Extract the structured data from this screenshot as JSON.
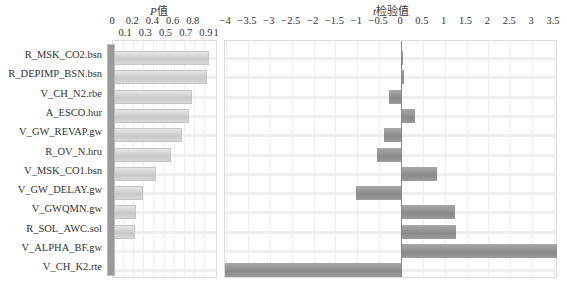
{
  "chart_data": [
    {
      "type": "bar",
      "orientation": "horizontal",
      "title": "P值",
      "xlabel": "P值",
      "xlim": [
        0,
        1
      ],
      "xticks_top": [
        "0",
        "0.2",
        "0.4",
        "0.6",
        "0.8"
      ],
      "xticks_bottom": [
        "0.1",
        "0.3",
        "0.5",
        "0.7",
        "0.9",
        "1"
      ],
      "grid": true,
      "categories": [
        "R_MSK_CO2.bsn",
        "R_DEPIMP_BSN.bsn",
        "V_CH_N2.rbe",
        "A_ESCO.hur",
        "V_GW_REVAP.gw",
        "R_OV_N.hru",
        "V_MSK_CO1.bsn",
        "V_GW_DELAY.gw",
        "V_GWQMN.gw",
        "R_SOL_AWC.sol",
        "V_ALPHA_BF.gw",
        "V_CH_K2.rte"
      ],
      "values": [
        0.95,
        0.93,
        0.78,
        0.75,
        0.68,
        0.57,
        0.43,
        0.3,
        0.23,
        0.22,
        0.0,
        0.0
      ]
    },
    {
      "type": "bar",
      "orientation": "horizontal",
      "title": "t检验值",
      "xlabel": "t检验值",
      "xlim": [
        -4,
        3.5
      ],
      "xticks": [
        "-4",
        "-3.5",
        "-3",
        "-2.5",
        "-2",
        "-1.5",
        "-1",
        "-0.5",
        "0",
        "0.5",
        "1",
        "1.5",
        "2",
        "2.5",
        "3",
        "3.5"
      ],
      "grid": true,
      "categories": [
        "R_MSK_CO2.bsn",
        "R_DEPIMP_BSN.bsn",
        "V_CH_N2.rbe",
        "A_ESCO.hur",
        "V_GW_REVAP.gw",
        "R_OV_N.hru",
        "V_MSK_CO1.bsn",
        "V_GW_DELAY.gw",
        "V_GWQMN.gw",
        "R_SOL_AWC.sol",
        "V_ALPHA_BF.gw",
        "V_CH_K2.rte"
      ],
      "values": [
        0.05,
        0.07,
        -0.27,
        0.32,
        -0.4,
        -0.55,
        0.82,
        -1.04,
        1.23,
        1.25,
        3.57,
        -4.05
      ]
    }
  ],
  "labels": {
    "p_title_italic": "P",
    "p_title_rest": "值",
    "t_title_italic": "t",
    "t_title_rest": "检验值"
  },
  "colors": {
    "p_bar": "#d2d2d2",
    "t_bar": "#959595",
    "grid": "#eeeeee"
  }
}
